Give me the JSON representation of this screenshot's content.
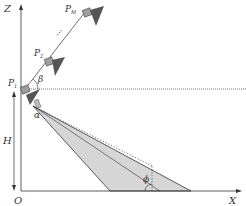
{
  "diagram": {
    "axes": {
      "z_label": "Z",
      "x_label": "X",
      "origin_label": "O"
    },
    "points": {
      "p1": "P",
      "p1_sub": "1",
      "p2": "P",
      "p2_sub": "2",
      "pm": "P",
      "pm_sub": "M",
      "ellipsis": "..."
    },
    "angles": {
      "beta": "β",
      "alpha": "α",
      "phi": "ϕ"
    },
    "height_label": "H",
    "colors": {
      "line": "#333333",
      "cone_fill": "#d6d6d6",
      "camera_body": "#9e9e9e",
      "camera_lens": "#555555"
    }
  }
}
